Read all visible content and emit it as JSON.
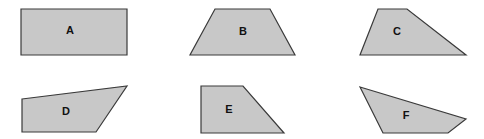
{
  "diagram": {
    "title": "",
    "fill_color": "#c8c8c8",
    "stroke_color": "#3a3a3a",
    "shapes": [
      {
        "label": "A",
        "type": "rectangle",
        "points": "21,9 127,9 127,55 21,55",
        "label_pos": [
          70,
          31
        ]
      },
      {
        "label": "B",
        "type": "trapezoid",
        "points": "215,9 270,9 295,55 190,55",
        "label_pos": [
          243,
          32
        ]
      },
      {
        "label": "C",
        "type": "trapezoid",
        "points": "378,9 407,9 466,55 360,55",
        "label_pos": [
          397,
          32
        ]
      },
      {
        "label": "D",
        "type": "quadrilateral",
        "points": "22,99 127,86 96,132 22,132",
        "label_pos": [
          66,
          112
        ]
      },
      {
        "label": "E",
        "type": "right-trapezoid",
        "points": "201,86 243,86 284,133 201,133",
        "label_pos": [
          229,
          110
        ]
      },
      {
        "label": "F",
        "type": "quadrilateral",
        "points": "360,87 466,119 448,133 383,133",
        "label_pos": [
          406,
          116
        ]
      }
    ]
  }
}
